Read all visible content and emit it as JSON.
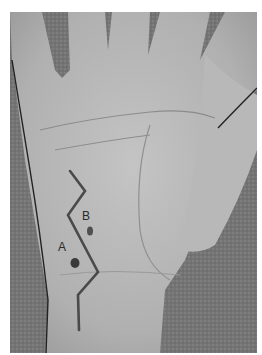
{
  "figure": {
    "type": "clinical photograph",
    "colors": {
      "background": "#7a7a7a",
      "skin": "#b5b5b5",
      "marking": "#4a4a4a",
      "border": "#ffffff"
    },
    "labels": [
      {
        "id": "A",
        "text": "A"
      },
      {
        "id": "B",
        "text": "B"
      }
    ]
  }
}
